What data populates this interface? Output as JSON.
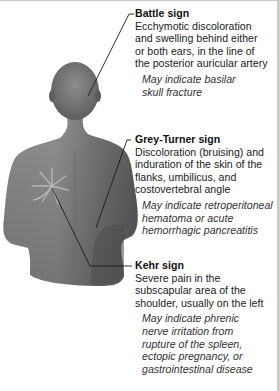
{
  "callouts": [
    {
      "title": "Battle sign",
      "description_lines": [
        "Ecchymotic discoloration",
        "and swelling behind either",
        "or both ears, in the line of",
        "the posterior auricular artery"
      ],
      "note_lines": [
        "May indicate basilar",
        "skull fracture"
      ]
    },
    {
      "title": "Grey-Turner sign",
      "description_lines": [
        "Discoloration (bruising) and",
        "induration of the skin of the",
        "flanks, umbilicus, and",
        "costovertebral angle"
      ],
      "note_lines": [
        "May indicate retroperitoneal",
        "hematoma or acute",
        "hemorrhagic pancreatitis"
      ]
    },
    {
      "title": "Kehr sign",
      "description_lines": [
        "Severe pain in the",
        "subscapular area of the",
        "shoulder, usually on the left"
      ],
      "note_lines": [
        "May indicate phrenic",
        "nerve irritation from",
        "rupture of the spleen,",
        "ectopic pregnancy, or",
        "gastrointestinal disease"
      ]
    }
  ],
  "figure": {
    "skin_color": "#7a7a7a",
    "line_color": "#1a1a1a"
  }
}
